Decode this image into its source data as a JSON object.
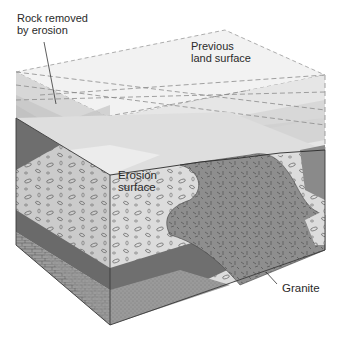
{
  "figure": {
    "labels": {
      "rock_removed": "Rock removed\nby erosion",
      "previous_surface": "Previous\nland surface",
      "erosion_surface": "Erosion\nsurface",
      "granite": "Granite"
    },
    "colors": {
      "removed_block_light": "#ebebeb",
      "removed_block_mid": "#d6d6d6",
      "removed_block_dark": "#bdbdbd",
      "erosion_surface": "#e4e4e4",
      "conglomerate": "#c9c9c9",
      "granite": "#8f8f8f",
      "dark_strata": "#6e6e6e",
      "limestone": "#9a9a9a",
      "outline": "#3a3a3a"
    }
  }
}
